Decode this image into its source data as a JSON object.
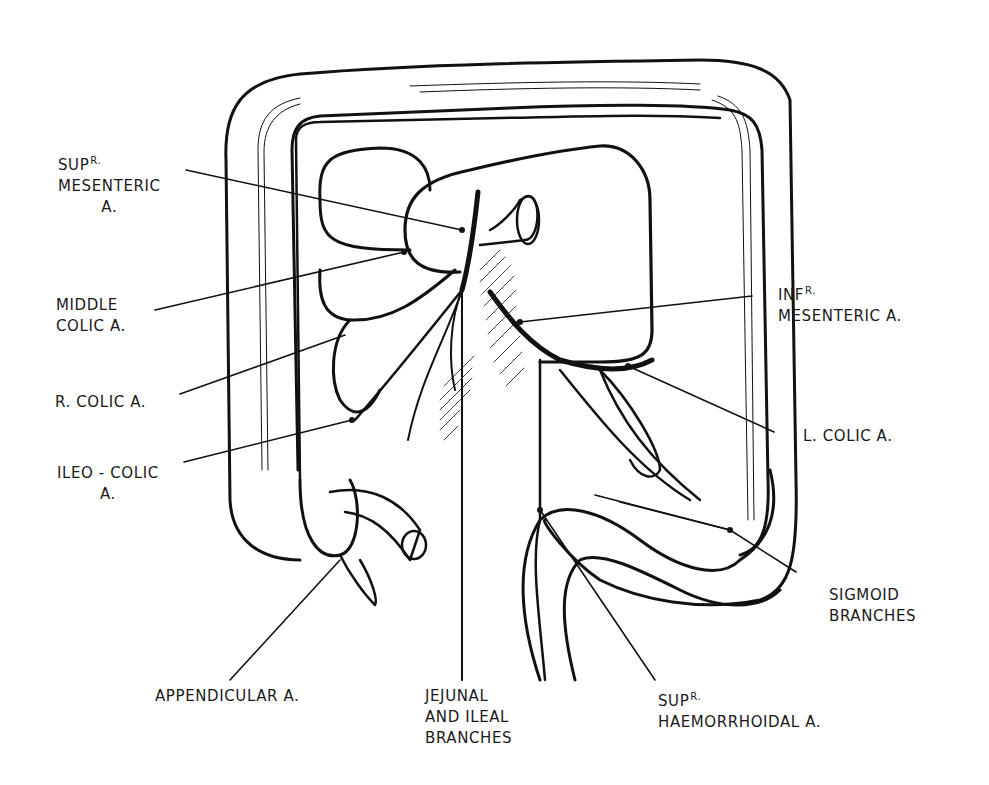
{
  "diagram": {
    "labels": {
      "sup_mesenteric": {
        "line1_main": "SUP",
        "line1_sup": "R.",
        "line2": "MESENTERIC",
        "line3": "A."
      },
      "middle_colic": {
        "line1": "MIDDLE",
        "line2": "COLIC A."
      },
      "r_colic": {
        "line1": "R. COLIC A."
      },
      "ileo_colic": {
        "line1": "ILEO - COLIC",
        "line2": "A."
      },
      "appendicular": {
        "line1": "APPENDICULAR A."
      },
      "jejunal_ileal": {
        "line1": "JEJUNAL",
        "line2": "AND ILEAL",
        "line3": "BRANCHES"
      },
      "sup_haemorrhoidal": {
        "line1_main": "SUP",
        "line1_sup": "R.",
        "line2": "HAEMORRHOIDAL A."
      },
      "inf_mesenteric": {
        "line1_main": "INF",
        "line1_sup": "R.",
        "line2": "MESENTERIC A."
      },
      "l_colic": {
        "line1": "L. COLIC A."
      },
      "sigmoid": {
        "line1": "SIGMOID",
        "line2": "BRANCHES"
      }
    },
    "colors": {
      "ink": "#111111",
      "background": "#ffffff"
    }
  }
}
